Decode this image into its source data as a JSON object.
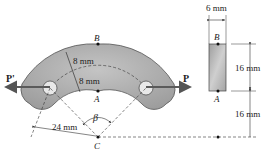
{
  "diagram": {
    "type": "mechanics-figure",
    "labels": {
      "point_B": "B",
      "point_A": "A",
      "point_C": "C",
      "force_left": "P'",
      "force_right": "P",
      "angle": "β",
      "dim_outer_thickness": "8 mm",
      "dim_inner_thickness": "8 mm",
      "dim_radius": "24 mm",
      "section_width": "6 mm",
      "section_height": "16 mm",
      "section_offset": "16 mm",
      "section_point_B": "B",
      "section_point_A": "A"
    },
    "colors": {
      "bar_fill": "#a9a9a9",
      "bar_stroke": "#555555",
      "arrow": "#5a5a5a",
      "line": "#333333"
    }
  }
}
